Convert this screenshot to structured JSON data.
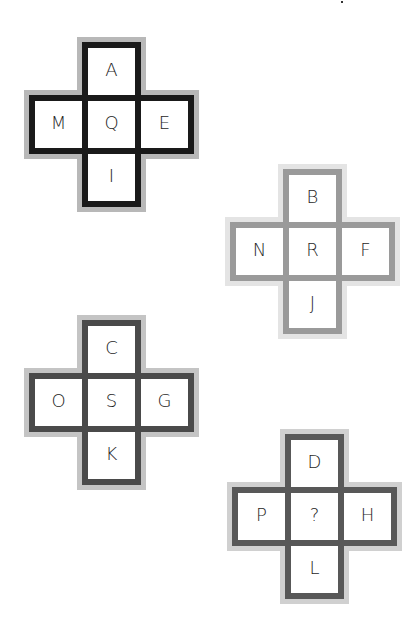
{
  "puzzle": {
    "crosses": [
      {
        "id": "cross-1",
        "position": {
          "left": 29,
          "top": 42
        },
        "border_color": "#1a1a1a",
        "halo_color": "#b8b8b8",
        "cells": {
          "top": "A",
          "left": "M",
          "center": "Q",
          "right": "E",
          "bottom": "I"
        }
      },
      {
        "id": "cross-2",
        "position": {
          "left": 230,
          "top": 169
        },
        "border_color": "#9a9a9a",
        "halo_color": "#e4e4e4",
        "cells": {
          "top": "B",
          "left": "N",
          "center": "R",
          "right": "F",
          "bottom": "J"
        }
      },
      {
        "id": "cross-3",
        "position": {
          "left": 29,
          "top": 320
        },
        "border_color": "#4a4a4a",
        "halo_color": "#c4c4c4",
        "cells": {
          "top": "C",
          "left": "O",
          "center": "S",
          "right": "G",
          "bottom": "K"
        }
      },
      {
        "id": "cross-4",
        "position": {
          "left": 232,
          "top": 434
        },
        "border_color": "#585858",
        "halo_color": "#d0d0d0",
        "cells": {
          "top": "D",
          "left": "P",
          "center": "?",
          "right": "H",
          "bottom": "L"
        }
      }
    ]
  }
}
